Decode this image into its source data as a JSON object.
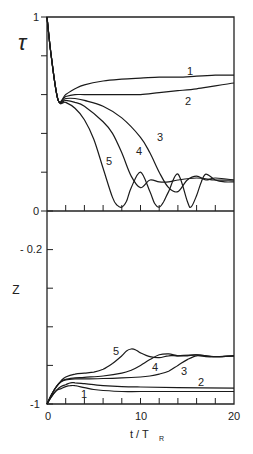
{
  "chart_data": [
    {
      "type": "line",
      "panel": "top",
      "title": "",
      "ylabel": "τ",
      "xlabel": "",
      "xlim": [
        0,
        20
      ],
      "ylim": [
        0,
        1
      ],
      "ytick_labels": [
        "0",
        "1"
      ],
      "yticks": [
        0,
        0.2,
        0.4,
        0.6,
        0.8,
        1
      ],
      "xticks": [
        0,
        2,
        4,
        6,
        8,
        10,
        12,
        14,
        16,
        18,
        20
      ],
      "grid": false,
      "series": [
        {
          "name": "1",
          "x": [
            0,
            0.5,
            1.2,
            2,
            3,
            4,
            6,
            8,
            10,
            12,
            14,
            16,
            18,
            20
          ],
          "y": [
            1,
            0.78,
            0.57,
            0.6,
            0.63,
            0.65,
            0.67,
            0.68,
            0.685,
            0.69,
            0.69,
            0.695,
            0.7,
            0.7
          ]
        },
        {
          "name": "2",
          "x": [
            0,
            0.5,
            1.2,
            2,
            3,
            4,
            6,
            8,
            10,
            12,
            14,
            16,
            18,
            20
          ],
          "y": [
            1,
            0.78,
            0.57,
            0.59,
            0.6,
            0.6,
            0.6,
            0.6,
            0.6,
            0.61,
            0.62,
            0.63,
            0.645,
            0.66
          ]
        },
        {
          "name": "3",
          "x": [
            0,
            0.5,
            1.2,
            2,
            3,
            4,
            6,
            8,
            10,
            11,
            12,
            13,
            14,
            15,
            16,
            17,
            18,
            20
          ],
          "y": [
            1,
            0.78,
            0.57,
            0.58,
            0.58,
            0.57,
            0.54,
            0.48,
            0.38,
            0.3,
            0.2,
            0.12,
            0.1,
            0.16,
            0.18,
            0.16,
            0.17,
            0.16
          ]
        },
        {
          "name": "4",
          "x": [
            0,
            0.5,
            1.2,
            2,
            3,
            4,
            6,
            7,
            8,
            9,
            10,
            11,
            12,
            13,
            14,
            16,
            18,
            20
          ],
          "y": [
            1,
            0.78,
            0.57,
            0.57,
            0.56,
            0.54,
            0.46,
            0.4,
            0.3,
            0.18,
            0.12,
            0.16,
            0.15,
            0.15,
            0.16,
            0.17,
            0.16,
            0.16
          ]
        },
        {
          "name": "5",
          "x": [
            0,
            0.5,
            1.2,
            2,
            3,
            4,
            5,
            6,
            7,
            7.5,
            8,
            8.5,
            9,
            10,
            11,
            11.5,
            12,
            12.5,
            13,
            14,
            15,
            15.4,
            16,
            16.5,
            17,
            18,
            19,
            20
          ],
          "y": [
            1,
            0.78,
            0.57,
            0.56,
            0.53,
            0.47,
            0.37,
            0.22,
            0.07,
            0.03,
            0.02,
            0.05,
            0.12,
            0.2,
            0.1,
            0.04,
            0.02,
            0.05,
            0.1,
            0.19,
            0.05,
            0.02,
            0.08,
            0.15,
            0.19,
            0.16,
            0.15,
            0.15
          ]
        }
      ]
    },
    {
      "type": "line",
      "panel": "bottom",
      "title": "",
      "ylabel": "Z",
      "xlabel": "t / T_R",
      "xlim": [
        0,
        20
      ],
      "ylim": [
        -1,
        0
      ],
      "ytick_labels": [
        "-1",
        "-0.2",
        "0"
      ],
      "yticks": [
        -1,
        -0.8,
        -0.6,
        -0.4,
        -0.2,
        0
      ],
      "xtick_labels": [
        "0",
        "10",
        "20"
      ],
      "xticks": [
        0,
        2,
        4,
        6,
        8,
        10,
        12,
        14,
        16,
        18,
        20
      ],
      "grid": false,
      "series": [
        {
          "name": "1",
          "x": [
            0,
            0.5,
            1,
            1.5,
            2,
            2.5,
            3,
            4,
            5,
            6,
            8,
            10,
            14,
            20
          ],
          "y": [
            -1,
            -0.96,
            -0.93,
            -0.92,
            -0.91,
            -0.905,
            -0.905,
            -0.915,
            -0.925,
            -0.93,
            -0.935,
            -0.935,
            -0.935,
            -0.935
          ]
        },
        {
          "name": "2",
          "x": [
            0,
            0.5,
            1,
            1.5,
            2,
            2.5,
            3,
            4,
            5,
            6,
            8,
            10,
            14,
            20
          ],
          "y": [
            -1,
            -0.96,
            -0.93,
            -0.91,
            -0.9,
            -0.89,
            -0.89,
            -0.895,
            -0.9,
            -0.905,
            -0.91,
            -0.912,
            -0.915,
            -0.918
          ]
        },
        {
          "name": "3",
          "x": [
            0,
            0.5,
            1,
            1.5,
            2,
            3,
            4,
            6,
            8,
            10,
            11,
            12,
            13,
            14,
            15,
            16,
            17,
            18,
            20
          ],
          "y": [
            -1,
            -0.95,
            -0.91,
            -0.885,
            -0.875,
            -0.87,
            -0.87,
            -0.868,
            -0.865,
            -0.86,
            -0.855,
            -0.845,
            -0.83,
            -0.8,
            -0.77,
            -0.75,
            -0.755,
            -0.755,
            -0.75
          ]
        },
        {
          "name": "4",
          "x": [
            0,
            0.5,
            1,
            1.5,
            2,
            3,
            4,
            6,
            8,
            9,
            10,
            11,
            12,
            13,
            14,
            15,
            16,
            18,
            20
          ],
          "y": [
            -1,
            -0.95,
            -0.91,
            -0.885,
            -0.872,
            -0.865,
            -0.862,
            -0.855,
            -0.84,
            -0.825,
            -0.8,
            -0.77,
            -0.745,
            -0.74,
            -0.75,
            -0.75,
            -0.745,
            -0.755,
            -0.75
          ]
        },
        {
          "name": "5",
          "x": [
            0,
            0.5,
            1,
            1.5,
            2,
            3,
            4,
            5,
            6,
            7,
            8,
            8.5,
            9,
            9.5,
            10,
            11,
            12,
            13,
            14,
            16,
            18,
            20
          ],
          "y": [
            -1,
            -0.95,
            -0.91,
            -0.88,
            -0.86,
            -0.845,
            -0.84,
            -0.835,
            -0.82,
            -0.79,
            -0.75,
            -0.725,
            -0.715,
            -0.72,
            -0.735,
            -0.755,
            -0.76,
            -0.75,
            -0.75,
            -0.745,
            -0.755,
            -0.75
          ]
        }
      ]
    }
  ],
  "labels": {
    "top_ylabel": "τ",
    "top_tick_1": "1",
    "top_tick_0": "0",
    "bottom_ylabel": "Z",
    "bottom_tick_m02": "- 0.2",
    "bottom_tick_m1": "-1",
    "x_tick_0": "0",
    "x_tick_10": "10",
    "x_tick_20": "20",
    "xlabel_main": "t / T",
    "xlabel_sub": "R",
    "top_curve_labels": [
      "1",
      "2",
      "3",
      "4",
      "5"
    ],
    "bottom_curve_labels": [
      "1",
      "2",
      "3",
      "4",
      "5"
    ]
  }
}
